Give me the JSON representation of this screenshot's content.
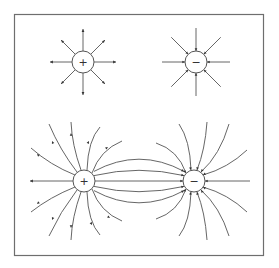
{
  "figure": {
    "colors": {
      "frame": "#6e6e6e",
      "lines": "#555555",
      "background": "#ffffff"
    },
    "charges": [
      {
        "id": "isolated-positive",
        "sign": "+",
        "cx": 83,
        "cy": 62,
        "r": 11
      },
      {
        "id": "isolated-negative",
        "sign": "−",
        "cx": 196,
        "cy": 62,
        "r": 11
      },
      {
        "id": "dipole-positive",
        "sign": "+",
        "cx": 84,
        "cy": 181,
        "r": 11
      },
      {
        "id": "dipole-negative",
        "sign": "−",
        "cx": 194,
        "cy": 181,
        "r": 11
      }
    ],
    "panels": [
      {
        "label": "isolated-positive-charge",
        "field_direction": "outward",
        "line_count": 8
      },
      {
        "label": "isolated-negative-charge",
        "field_direction": "inward",
        "line_count": 8
      },
      {
        "label": "dipole",
        "field_direction": "positive-to-negative",
        "line_count": 16
      }
    ]
  }
}
